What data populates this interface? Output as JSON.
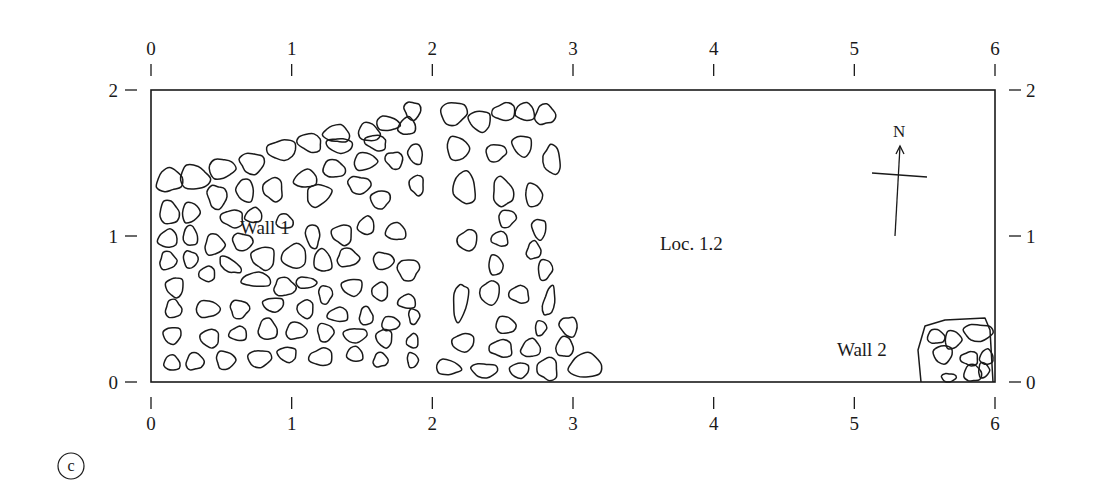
{
  "figure": {
    "panel_label": "c",
    "x_axis": {
      "ticks": [
        "0",
        "1",
        "2",
        "3",
        "4",
        "5",
        "6"
      ],
      "range": [
        0,
        6
      ]
    },
    "y_axis": {
      "ticks": [
        "0",
        "1",
        "2"
      ],
      "range": [
        0,
        2
      ]
    },
    "labels": {
      "wall1": "Wall 1",
      "wall2": "Wall 2",
      "locus": "Loc. 1.2",
      "north": "N"
    },
    "colors": {
      "ink": "#1a1a1a",
      "background": "#ffffff"
    }
  },
  "stones": [
    [
      0.13,
      1.38,
      0.09,
      0.08,
      10
    ],
    [
      0.31,
      1.4,
      0.11,
      0.08,
      -5
    ],
    [
      0.5,
      1.46,
      0.09,
      0.07,
      0
    ],
    [
      0.72,
      1.5,
      0.09,
      0.07,
      0
    ],
    [
      0.93,
      1.59,
      0.1,
      0.07,
      0
    ],
    [
      1.13,
      1.64,
      0.09,
      0.06,
      -10
    ],
    [
      1.32,
      1.7,
      0.09,
      0.06,
      -10
    ],
    [
      1.55,
      1.71,
      0.08,
      0.06,
      -10
    ],
    [
      1.68,
      1.77,
      0.08,
      0.05,
      -10
    ],
    [
      1.86,
      1.86,
      0.06,
      0.06,
      0
    ],
    [
      1.34,
      1.62,
      0.09,
      0.05,
      -10
    ],
    [
      1.6,
      1.64,
      0.08,
      0.05,
      -10
    ],
    [
      1.82,
      1.75,
      0.06,
      0.06,
      0
    ],
    [
      0.13,
      1.16,
      0.07,
      0.08,
      0
    ],
    [
      0.28,
      1.16,
      0.06,
      0.07,
      0
    ],
    [
      0.47,
      1.27,
      0.07,
      0.08,
      0
    ],
    [
      0.67,
      1.31,
      0.06,
      0.08,
      20
    ],
    [
      0.87,
      1.32,
      0.07,
      0.08,
      0
    ],
    [
      1.1,
      1.39,
      0.08,
      0.06,
      0
    ],
    [
      1.3,
      1.46,
      0.08,
      0.06,
      0
    ],
    [
      1.52,
      1.51,
      0.08,
      0.06,
      0
    ],
    [
      1.73,
      1.52,
      0.06,
      0.06,
      20
    ],
    [
      1.88,
      1.56,
      0.05,
      0.07,
      20
    ],
    [
      0.58,
      1.12,
      0.08,
      0.06,
      0
    ],
    [
      0.73,
      1.14,
      0.06,
      0.05,
      0
    ],
    [
      0.95,
      1.1,
      0.06,
      0.05,
      0
    ],
    [
      1.19,
      1.28,
      0.09,
      0.07,
      20
    ],
    [
      1.48,
      1.35,
      0.08,
      0.06,
      0
    ],
    [
      1.63,
      1.25,
      0.07,
      0.06,
      0
    ],
    [
      1.89,
      1.35,
      0.05,
      0.07,
      0
    ],
    [
      0.12,
      0.98,
      0.07,
      0.06,
      0
    ],
    [
      0.28,
      1.0,
      0.05,
      0.07,
      0
    ],
    [
      0.45,
      0.94,
      0.07,
      0.07,
      0
    ],
    [
      0.65,
      0.96,
      0.07,
      0.06,
      0
    ],
    [
      1.15,
      1.0,
      0.05,
      0.08,
      10
    ],
    [
      1.36,
      1.01,
      0.07,
      0.07,
      0
    ],
    [
      1.53,
      1.07,
      0.06,
      0.06,
      0
    ],
    [
      1.74,
      1.03,
      0.07,
      0.06,
      0
    ],
    [
      0.12,
      0.83,
      0.06,
      0.06,
      0
    ],
    [
      0.28,
      0.84,
      0.05,
      0.06,
      0
    ],
    [
      0.56,
      0.8,
      0.09,
      0.04,
      -35
    ],
    [
      0.8,
      0.85,
      0.08,
      0.08,
      0
    ],
    [
      1.02,
      0.86,
      0.09,
      0.08,
      0
    ],
    [
      1.22,
      0.83,
      0.06,
      0.08,
      10
    ],
    [
      1.4,
      0.85,
      0.08,
      0.06,
      0
    ],
    [
      1.65,
      0.83,
      0.07,
      0.06,
      0
    ],
    [
      1.83,
      0.77,
      0.08,
      0.07,
      10
    ],
    [
      0.17,
      0.65,
      0.06,
      0.07,
      0
    ],
    [
      0.4,
      0.74,
      0.06,
      0.05,
      0
    ],
    [
      0.75,
      0.7,
      0.1,
      0.05,
      0
    ],
    [
      0.95,
      0.65,
      0.08,
      0.06,
      0
    ],
    [
      1.1,
      0.68,
      0.07,
      0.04,
      0
    ],
    [
      1.24,
      0.6,
      0.05,
      0.06,
      0
    ],
    [
      1.43,
      0.65,
      0.07,
      0.06,
      0
    ],
    [
      1.63,
      0.62,
      0.06,
      0.06,
      0
    ],
    [
      1.82,
      0.55,
      0.06,
      0.05,
      0
    ],
    [
      0.16,
      0.5,
      0.06,
      0.06,
      0
    ],
    [
      0.4,
      0.5,
      0.08,
      0.06,
      0
    ],
    [
      0.63,
      0.5,
      0.07,
      0.06,
      0
    ],
    [
      0.87,
      0.53,
      0.07,
      0.05,
      0
    ],
    [
      1.1,
      0.5,
      0.06,
      0.06,
      0
    ],
    [
      1.33,
      0.46,
      0.07,
      0.05,
      0
    ],
    [
      1.53,
      0.45,
      0.05,
      0.06,
      0
    ],
    [
      1.7,
      0.4,
      0.06,
      0.05,
      0
    ],
    [
      1.87,
      0.45,
      0.04,
      0.05,
      0
    ],
    [
      0.15,
      0.32,
      0.06,
      0.06,
      0
    ],
    [
      0.42,
      0.3,
      0.07,
      0.06,
      0
    ],
    [
      0.62,
      0.33,
      0.06,
      0.05,
      0
    ],
    [
      0.83,
      0.36,
      0.07,
      0.07,
      0
    ],
    [
      1.03,
      0.35,
      0.07,
      0.06,
      0
    ],
    [
      1.24,
      0.34,
      0.06,
      0.06,
      0
    ],
    [
      1.45,
      0.32,
      0.08,
      0.05,
      0
    ],
    [
      1.66,
      0.3,
      0.06,
      0.06,
      0
    ],
    [
      1.86,
      0.28,
      0.04,
      0.05,
      0
    ],
    [
      0.15,
      0.13,
      0.06,
      0.05,
      0
    ],
    [
      0.31,
      0.14,
      0.06,
      0.06,
      0
    ],
    [
      0.53,
      0.15,
      0.07,
      0.06,
      0
    ],
    [
      0.77,
      0.16,
      0.08,
      0.06,
      0
    ],
    [
      0.97,
      0.19,
      0.07,
      0.05,
      0
    ],
    [
      1.21,
      0.17,
      0.08,
      0.06,
      0
    ],
    [
      1.45,
      0.19,
      0.06,
      0.05,
      0
    ],
    [
      1.63,
      0.15,
      0.05,
      0.05,
      0
    ],
    [
      1.86,
      0.15,
      0.04,
      0.05,
      0
    ],
    [
      2.15,
      1.84,
      0.09,
      0.08,
      0
    ],
    [
      2.34,
      1.79,
      0.08,
      0.07,
      0
    ],
    [
      2.51,
      1.85,
      0.08,
      0.06,
      0
    ],
    [
      2.66,
      1.85,
      0.07,
      0.06,
      0
    ],
    [
      2.8,
      1.83,
      0.07,
      0.07,
      0
    ],
    [
      2.18,
      1.6,
      0.08,
      0.08,
      0
    ],
    [
      2.45,
      1.57,
      0.07,
      0.06,
      0
    ],
    [
      2.64,
      1.62,
      0.07,
      0.07,
      0
    ],
    [
      2.85,
      1.52,
      0.06,
      0.1,
      10
    ],
    [
      2.23,
      1.33,
      0.08,
      0.11,
      0
    ],
    [
      2.5,
      1.3,
      0.07,
      0.1,
      15
    ],
    [
      2.72,
      1.28,
      0.06,
      0.08,
      0
    ],
    [
      2.53,
      1.12,
      0.06,
      0.06,
      0
    ],
    [
      2.76,
      1.05,
      0.05,
      0.07,
      0
    ],
    [
      2.25,
      0.97,
      0.07,
      0.07,
      0
    ],
    [
      2.48,
      0.98,
      0.06,
      0.05,
      0
    ],
    [
      2.72,
      0.9,
      0.05,
      0.06,
      0
    ],
    [
      2.45,
      0.8,
      0.05,
      0.07,
      0
    ],
    [
      2.8,
      0.77,
      0.05,
      0.07,
      0
    ],
    [
      2.2,
      0.55,
      0.05,
      0.13,
      -10
    ],
    [
      2.41,
      0.61,
      0.07,
      0.08,
      0
    ],
    [
      2.62,
      0.6,
      0.07,
      0.06,
      0
    ],
    [
      2.83,
      0.55,
      0.04,
      0.1,
      -10
    ],
    [
      2.52,
      0.39,
      0.07,
      0.06,
      0
    ],
    [
      2.77,
      0.37,
      0.04,
      0.05,
      0
    ],
    [
      2.97,
      0.38,
      0.06,
      0.07,
      15
    ],
    [
      2.22,
      0.27,
      0.08,
      0.06,
      0
    ],
    [
      2.49,
      0.23,
      0.08,
      0.06,
      0
    ],
    [
      2.7,
      0.23,
      0.07,
      0.06,
      0
    ],
    [
      2.94,
      0.24,
      0.06,
      0.07,
      -15
    ],
    [
      2.11,
      0.1,
      0.09,
      0.05,
      -10
    ],
    [
      2.37,
      0.08,
      0.09,
      0.05,
      0
    ],
    [
      2.62,
      0.08,
      0.07,
      0.05,
      0
    ],
    [
      2.82,
      0.09,
      0.07,
      0.08,
      0
    ],
    [
      3.09,
      0.11,
      0.12,
      0.08,
      0
    ],
    [
      5.58,
      0.31,
      0.06,
      0.05,
      0
    ],
    [
      5.7,
      0.29,
      0.06,
      0.06,
      0
    ],
    [
      5.88,
      0.34,
      0.1,
      0.06,
      0
    ],
    [
      5.63,
      0.19,
      0.07,
      0.06,
      0
    ],
    [
      5.82,
      0.16,
      0.06,
      0.05,
      0
    ],
    [
      5.94,
      0.17,
      0.05,
      0.05,
      0
    ],
    [
      5.84,
      0.06,
      0.06,
      0.06,
      0
    ],
    [
      5.92,
      0.08,
      0.04,
      0.05,
      0
    ],
    [
      5.67,
      0.03,
      0.05,
      0.03,
      0
    ]
  ]
}
